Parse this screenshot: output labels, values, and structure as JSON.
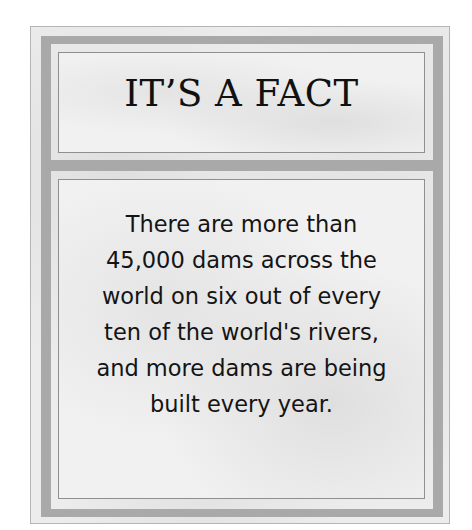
{
  "card": {
    "title": "IT’S A FACT",
    "body_lines": [
      "There are more than",
      "45,000 dams across the",
      "world on six out of every",
      "ten of the world's rivers,",
      "and more dams are being",
      "built every year."
    ]
  },
  "colors": {
    "background": "#ffffff",
    "frame_band": "#a9a9a9",
    "panel_fill": "#f1f1f1",
    "text": "#141414"
  }
}
